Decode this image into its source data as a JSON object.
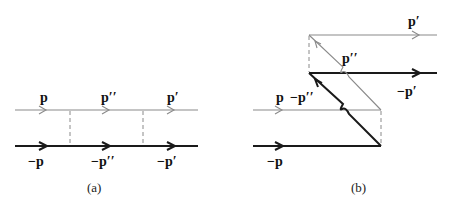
{
  "diagram_a": {
    "caption": "(a)",
    "top_labels": [
      "p",
      "p′′",
      "p′"
    ],
    "bottom_labels": [
      "−p",
      "−p′′",
      "−p′"
    ],
    "description": "Ladder diagram: upper thin particle line and lower thick antiparticle line connected by two dashed exchange rungs"
  },
  "diagram_b": {
    "caption": "(b)",
    "labels": {
      "out_top": "p′",
      "mid_diag": "p′′",
      "out_mid": "−p′",
      "in_top": "p",
      "in_diag": "−p′′",
      "in_bottom": "−p"
    },
    "description": "Crossed (Z-graph) diagram with diagonal backward-propagating lines and dashed exchange rungs"
  },
  "colors": {
    "thin_line": "#8a8a8a",
    "thick_line": "#1a1a1a",
    "background": "#ffffff"
  }
}
